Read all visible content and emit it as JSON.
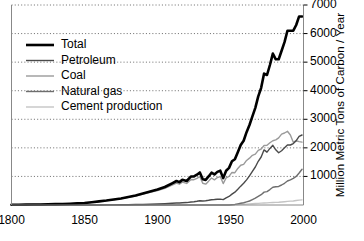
{
  "chart_data": {
    "type": "line",
    "title": "",
    "subtitle": "",
    "xlabel": "",
    "ylabel": "Million Metric Tons of Carbon / Year",
    "xlim": [
      1800,
      2000
    ],
    "ylim": [
      0,
      7000
    ],
    "xticks": [
      1800,
      1850,
      1900,
      1950,
      2000
    ],
    "xtick_labels": [
      "1800",
      "1850",
      "1900",
      "1950",
      "2000"
    ],
    "yticks": [
      1000,
      2000,
      3000,
      4000,
      5000,
      6000,
      7000
    ],
    "ytick_labels": [
      "1000",
      "2000",
      "3000",
      "4000",
      "5000",
      "6000",
      "7000"
    ],
    "grid": "horizontal-dotted",
    "legend_position": "upper-left",
    "x": [
      1800,
      1805,
      1810,
      1815,
      1820,
      1825,
      1830,
      1835,
      1840,
      1845,
      1850,
      1855,
      1860,
      1865,
      1870,
      1875,
      1880,
      1885,
      1890,
      1895,
      1900,
      1905,
      1910,
      1913,
      1915,
      1917,
      1920,
      1923,
      1925,
      1927,
      1929,
      1931,
      1933,
      1935,
      1937,
      1939,
      1941,
      1943,
      1945,
      1947,
      1949,
      1951,
      1953,
      1955,
      1957,
      1959,
      1961,
      1963,
      1965,
      1967,
      1969,
      1971,
      1973,
      1975,
      1977,
      1979,
      1981,
      1983,
      1985,
      1987,
      1989,
      1991,
      1993,
      1995,
      1997,
      1999
    ],
    "series": [
      {
        "name": "Total",
        "color": "#000000",
        "width": 2.6,
        "values": [
          8,
          10,
          13,
          16,
          20,
          25,
          30,
          37,
          46,
          58,
          72,
          98,
          126,
          155,
          190,
          230,
          280,
          330,
          400,
          470,
          540,
          630,
          760,
          840,
          800,
          880,
          840,
          1000,
          1000,
          1060,
          1140,
          900,
          880,
          1000,
          1130,
          1070,
          1160,
          1200,
          940,
          1200,
          1300,
          1530,
          1600,
          1850,
          2100,
          2250,
          2550,
          2800,
          3100,
          3400,
          3800,
          4100,
          4600,
          4550,
          4900,
          5300,
          5100,
          5100,
          5400,
          5700,
          6100,
          6100,
          6100,
          6300,
          6600,
          6600
        ]
      },
      {
        "name": "Petroleum",
        "color": "#4a4a4a",
        "width": 1.4,
        "values": [
          0,
          0,
          0,
          0,
          0,
          0,
          0,
          0,
          0,
          0,
          0,
          0,
          2,
          3,
          5,
          8,
          11,
          15,
          20,
          26,
          34,
          45,
          60,
          70,
          72,
          80,
          85,
          105,
          115,
          130,
          150,
          140,
          150,
          165,
          185,
          190,
          200,
          205,
          190,
          250,
          300,
          380,
          450,
          550,
          660,
          760,
          880,
          1020,
          1180,
          1330,
          1530,
          1680,
          1930,
          1850,
          1980,
          2090,
          1930,
          1830,
          1900,
          2000,
          2100,
          2100,
          2150,
          2250,
          2400,
          2450
        ]
      },
      {
        "name": "Coal",
        "color": "#9a9a9a",
        "width": 1.4,
        "values": [
          8,
          10,
          13,
          16,
          20,
          25,
          30,
          37,
          46,
          58,
          72,
          98,
          124,
          152,
          185,
          222,
          269,
          315,
          380,
          444,
          506,
          585,
          700,
          770,
          728,
          800,
          755,
          895,
          885,
          930,
          990,
          760,
          730,
          835,
          945,
          880,
          960,
          995,
          750,
          950,
          1000,
          1140,
          1130,
          1280,
          1390,
          1420,
          1560,
          1640,
          1740,
          1780,
          1910,
          1960,
          2080,
          2090,
          2180,
          2250,
          2280,
          2350,
          2480,
          2520,
          2580,
          2450,
          2200,
          2250,
          2220,
          2200
        ]
      },
      {
        "name": "Natural gas",
        "color": "#6e6e6e",
        "width": 1.4,
        "values": [
          0,
          0,
          0,
          0,
          0,
          0,
          0,
          0,
          0,
          0,
          0,
          0,
          0,
          0,
          0,
          0,
          0,
          0,
          0,
          0,
          0,
          0,
          0,
          0,
          0,
          0,
          0,
          0,
          0,
          0,
          0,
          0,
          0,
          0,
          0,
          0,
          0,
          0,
          0,
          0,
          0,
          10,
          20,
          40,
          60,
          80,
          110,
          140,
          190,
          240,
          300,
          360,
          450,
          470,
          540,
          620,
          640,
          650,
          700,
          760,
          840,
          880,
          930,
          1000,
          1120,
          1250
        ]
      },
      {
        "name": "Cement production",
        "color": "#c4c4c4",
        "width": 1.4,
        "values": [
          0,
          0,
          0,
          0,
          0,
          0,
          0,
          0,
          0,
          0,
          0,
          0,
          0,
          0,
          0,
          0,
          0,
          0,
          0,
          0,
          0,
          0,
          0,
          0,
          0,
          0,
          0,
          0,
          0,
          0,
          0,
          0,
          0,
          0,
          0,
          0,
          0,
          0,
          0,
          0,
          0,
          10,
          14,
          18,
          23,
          27,
          32,
          38,
          44,
          50,
          57,
          64,
          72,
          74,
          82,
          90,
          92,
          96,
          104,
          114,
          126,
          134,
          142,
          156,
          170,
          180
        ]
      }
    ]
  },
  "legend": {
    "items": [
      {
        "label": "Total"
      },
      {
        "label": "Petroleum"
      },
      {
        "label": "Coal"
      },
      {
        "label": "Natural gas"
      },
      {
        "label": "Cement production"
      }
    ]
  }
}
